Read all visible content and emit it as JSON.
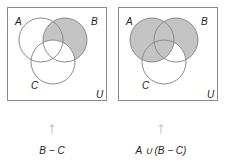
{
  "colors": {
    "shade": "#c4c4c4",
    "stroke": "#8a8a8a",
    "box": "#8a8a8a",
    "background": "#ffffff"
  },
  "panels": [
    {
      "set_labels": {
        "A": "A",
        "B": "B",
        "C": "C",
        "U": "U"
      },
      "caption": "B − C",
      "shaded_region": "B minus C"
    },
    {
      "set_labels": {
        "A": "A",
        "B": "B",
        "C": "C",
        "U": "U"
      },
      "caption": "A ∪ (B − C)",
      "shaded_region": "A union (B minus C)"
    }
  ],
  "arrow_icon": "up-arrow-icon"
}
